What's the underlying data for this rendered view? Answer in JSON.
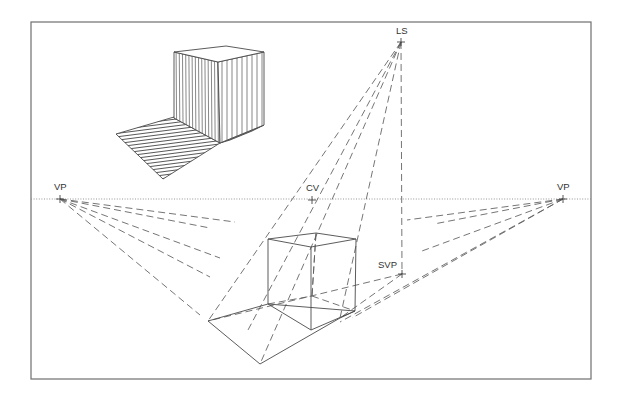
{
  "diagram": {
    "colors": {
      "line": "#4a4a4a",
      "dashed": "#5c5c5c",
      "frame": "#6f6f6f",
      "background": "#ffffff"
    },
    "frame": {
      "x": 31,
      "y": 22,
      "width": 560,
      "height": 357
    },
    "horizon": {
      "y": 199,
      "x1": 31,
      "x2": 591,
      "style": "dotted"
    },
    "points": [
      {
        "id": "vp-left",
        "label": "VP",
        "x": 60,
        "y": 199,
        "label_x": 54,
        "label_y": 190
      },
      {
        "id": "cv",
        "label": "CV",
        "x": 312,
        "y": 200,
        "label_x": 306,
        "label_y": 191
      },
      {
        "id": "vp-right",
        "label": "VP",
        "x": 563,
        "y": 199,
        "label_x": 557,
        "label_y": 190
      },
      {
        "id": "ls",
        "label": "LS",
        "x": 401,
        "y": 42,
        "label_x": 396,
        "label_y": 34
      },
      {
        "id": "svp",
        "label": "SVP",
        "x": 402,
        "y": 274,
        "label_x": 378,
        "label_y": 268
      }
    ],
    "inset_solid_cube": {
      "front_left_face": "174,52 218,62 220,143 174,118",
      "front_right_face": "218,62 264,52 264,125 220,143",
      "top_face": "174,52 226,46 264,52 218,62",
      "shadow": "174,117 116,134 163,179 220,143 174,118",
      "shadow_sliver": "220,143 264,125 252,131 230,140"
    },
    "wire_cube": {
      "top": "268,239 316,233 356,239 311,247",
      "edges": [
        [
          268,
          239,
          268,
          304
        ],
        [
          311,
          247,
          311,
          330
        ],
        [
          356,
          239,
          355,
          311
        ],
        [
          268,
          304,
          311,
          330
        ],
        [
          311,
          330,
          355,
          311
        ]
      ],
      "hidden_edges": [
        [
          268,
          304,
          312,
          296
        ],
        [
          312,
          296,
          355,
          311
        ],
        [
          312,
          296,
          316,
          233
        ]
      ]
    },
    "cast_shadow": {
      "outline": "268,304 208,321 260,364 340,318 355,311"
    },
    "dashed_lines": [
      [
        60,
        199,
        235,
        222
      ],
      [
        60,
        199,
        210,
        228
      ],
      [
        60,
        199,
        220,
        258
      ],
      [
        60,
        199,
        210,
        277
      ],
      [
        60,
        199,
        200,
        315
      ],
      [
        563,
        199,
        407,
        220
      ],
      [
        563,
        199,
        434,
        224
      ],
      [
        563,
        199,
        422,
        251
      ],
      [
        563,
        199,
        352,
        318
      ],
      [
        563,
        199,
        340,
        322
      ],
      [
        401,
        42,
        208,
        321
      ],
      [
        401,
        42,
        260,
        364
      ],
      [
        401,
        42,
        340,
        318
      ],
      [
        401,
        42,
        248,
        330
      ],
      [
        401,
        42,
        402,
        274
      ],
      [
        402,
        274,
        208,
        321
      ],
      [
        402,
        274,
        340,
        318
      ],
      [
        316,
        233,
        312,
        296
      ]
    ]
  }
}
